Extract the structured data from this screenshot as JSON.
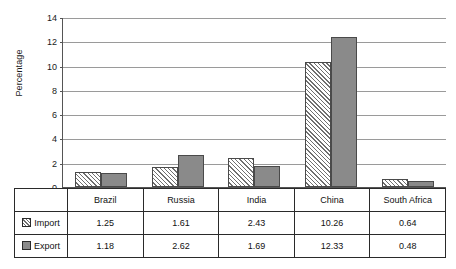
{
  "chart_data": {
    "type": "bar",
    "title": "",
    "xlabel": "",
    "ylabel": "Percentage",
    "categories": [
      "Brazil",
      "Russia",
      "India",
      "China",
      "South Africa"
    ],
    "series": [
      {
        "name": "Import",
        "values": [
          1.25,
          1.61,
          2.43,
          10.26,
          0.64
        ],
        "pattern": "diagonal-hatch",
        "color": "#ffffff"
      },
      {
        "name": "Export",
        "values": [
          1.18,
          2.62,
          1.69,
          12.33,
          0.48
        ],
        "pattern": "solid",
        "color": "#8a8a8a"
      }
    ],
    "ylim": [
      0,
      14
    ],
    "yticks": [
      0,
      2,
      4,
      6,
      8,
      10,
      12,
      14
    ],
    "ytick_labels": [
      "0",
      "2",
      "4",
      "6",
      "8",
      "10",
      "12",
      "14"
    ],
    "grid": true,
    "grid_axis": "y",
    "legend_position": "data-table-left-column"
  },
  "axis": {
    "y_title": "Percentage",
    "ticks": [
      {
        "value": 14,
        "label": "14"
      },
      {
        "value": 12,
        "label": "12"
      },
      {
        "value": 10,
        "label": "10"
      },
      {
        "value": 8,
        "label": "8"
      },
      {
        "value": 6,
        "label": "6"
      },
      {
        "value": 4,
        "label": "4"
      },
      {
        "value": 2,
        "label": "2"
      },
      {
        "value": 0,
        "label": "0"
      }
    ]
  },
  "table": {
    "category_row": [
      "Brazil",
      "Russia",
      "India",
      "China",
      "South Africa"
    ],
    "rows": [
      {
        "label": "Import",
        "swatch": "hatched-swatch-icon",
        "values": [
          "1.25",
          "1.61",
          "2.43",
          "10.26",
          "0.64"
        ]
      },
      {
        "label": "Export",
        "swatch": "solid-gray-swatch-icon",
        "values": [
          "1.18",
          "2.62",
          "1.69",
          "12.33",
          "0.48"
        ]
      }
    ]
  },
  "style": {
    "import_color": "#ffffff",
    "export_color": "#8a8a8a",
    "grid_color": "#9a9a9a",
    "axis_color": "#555555",
    "border_color": "#2a2a2a",
    "background": "#ffffff"
  }
}
